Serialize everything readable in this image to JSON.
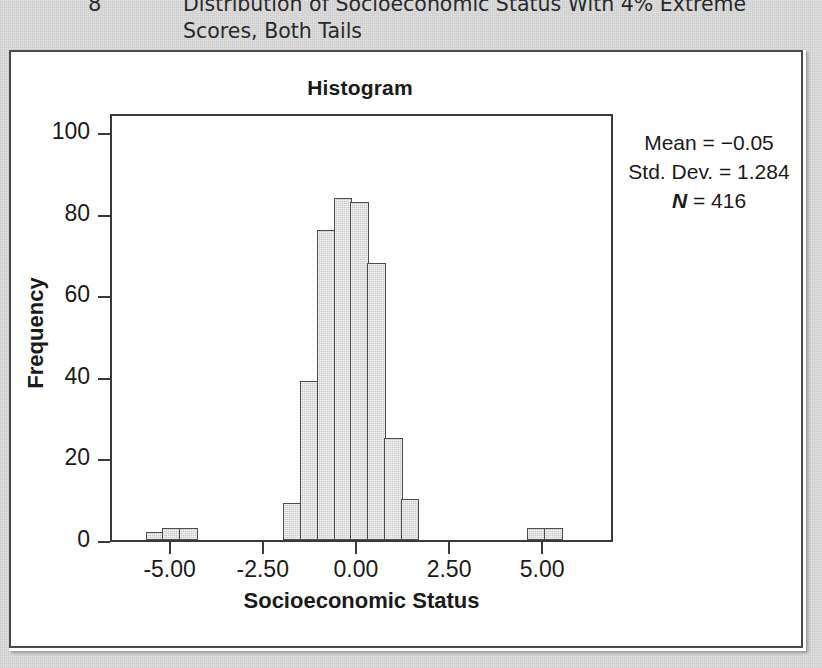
{
  "caption": {
    "number": "8",
    "line1": "Distribution of Socioeconomic Status With 4% Extreme",
    "line2": "Scores, Both Tails"
  },
  "chart_data": {
    "type": "bar",
    "title": "Histogram",
    "xlabel": "Socioeconomic Status",
    "ylabel": "Frequency",
    "xlim": [
      -6.6,
      6.9
    ],
    "ylim": [
      0,
      105
    ],
    "xticks": [
      "-5.00",
      "-2.50",
      "0.00",
      "2.50",
      "5.00"
    ],
    "xtick_values": [
      -5.0,
      -2.5,
      0.0,
      2.5,
      5.0
    ],
    "yticks": [
      "0",
      "20",
      "40",
      "60",
      "80",
      "100"
    ],
    "ytick_values": [
      0,
      20,
      40,
      60,
      80,
      100
    ],
    "grid": false,
    "bin_width": 0.5,
    "bins": [
      {
        "center": -5.45,
        "value": 2
      },
      {
        "center": -5.0,
        "value": 3
      },
      {
        "center": -4.55,
        "value": 3
      },
      {
        "center": -1.75,
        "value": 9
      },
      {
        "center": -1.3,
        "value": 39
      },
      {
        "center": -0.85,
        "value": 76
      },
      {
        "center": -0.4,
        "value": 84
      },
      {
        "center": 0.05,
        "value": 83
      },
      {
        "center": 0.5,
        "value": 68
      },
      {
        "center": 0.95,
        "value": 25
      },
      {
        "center": 1.4,
        "value": 10
      },
      {
        "center": 4.8,
        "value": 3
      },
      {
        "center": 5.25,
        "value": 3
      }
    ],
    "annotations": {
      "mean_label": "Mean = −0.05",
      "std_label": "Std. Dev. = 1.284",
      "n_prefix": "N",
      "n_label": " = 416",
      "mean": -0.05,
      "std_dev": 1.284,
      "n": 416
    },
    "colors": {
      "bar_fill": "#c9c9c9",
      "bar_edge": "#4d4d4d",
      "axis": "#3a3a3a",
      "text": "#1a1a1a",
      "panel_bg": "#ffffff",
      "page_bg": "#dedede"
    }
  }
}
